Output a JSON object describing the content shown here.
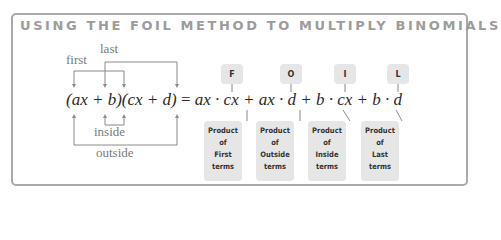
{
  "title": "USING THE FOIL METHOD TO MULTIPLY BINOMIALS",
  "labels": {
    "first": "first",
    "last": "last",
    "inside": "inside",
    "outside": "outside"
  },
  "equation": {
    "lhs": "(ax + b)(cx + d)",
    "equals": "=",
    "rhs": "ax · cx + ax · d + b · cx + b · d"
  },
  "foil": [
    {
      "letter": "F",
      "lines": [
        "Product",
        "of",
        "First",
        "terms"
      ]
    },
    {
      "letter": "O",
      "lines": [
        "Product",
        "of",
        "Outside",
        "terms"
      ]
    },
    {
      "letter": "I",
      "lines": [
        "Product",
        "of",
        "Inside",
        "terms"
      ]
    },
    {
      "letter": "L",
      "lines": [
        "Product",
        "of",
        "Last",
        "terms"
      ]
    }
  ],
  "colors": {
    "border": "#a9a9a9",
    "title": "#9c9c9c",
    "box": "#e6e6e6",
    "label": "#7a7a7a"
  }
}
